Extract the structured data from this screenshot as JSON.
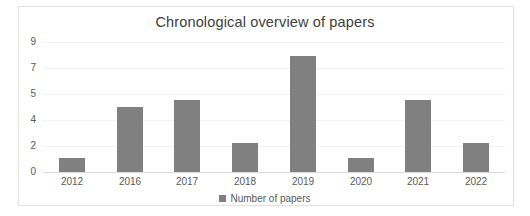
{
  "chart_data": {
    "type": "bar",
    "title": "Chronological overview of papers",
    "xlabel": "",
    "ylabel": "",
    "categories": [
      "2012",
      "2016",
      "2017",
      "2018",
      "2019",
      "2020",
      "2021",
      "2022"
    ],
    "values": [
      1,
      4.5,
      5,
      2,
      8,
      1,
      5,
      2
    ],
    "series": [
      {
        "name": "Number of papers",
        "values": [
          1,
          4.5,
          5,
          2,
          8,
          1,
          5,
          2
        ],
        "color": "#808080"
      }
    ],
    "ytick_labels": [
      "9",
      "7",
      "5",
      "4",
      "2",
      "0"
    ],
    "ytick_positions": [
      9,
      7,
      5,
      4,
      2,
      0
    ],
    "ylim": [
      0,
      9
    ],
    "grid": true,
    "legend": {
      "position": "bottom",
      "entries": [
        "Number of papers"
      ]
    },
    "bar_color": "#808080",
    "gridline_color": "#f2f2f2",
    "axis_color": "#d9d9d9",
    "text_color": "#595959",
    "title_color": "#404040",
    "background": "#ffffff"
  }
}
